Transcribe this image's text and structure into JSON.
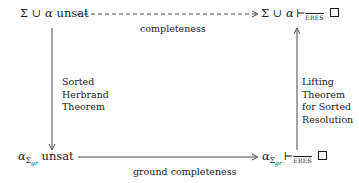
{
  "nodes": {
    "top_left": {
      "sigma": "Σ",
      "cup": "∪",
      "alpha": "α",
      "text": "unsat"
    },
    "top_right": {
      "sigma": "Σ",
      "cup": "∪",
      "alpha": "α",
      "turnstile": "⊢",
      "subscript": "ERES",
      "qed": "□"
    },
    "bottom_left": {
      "alpha": "α",
      "sub_sigma": "Σ",
      "sub_gr": "gr",
      "text": "unsat"
    },
    "bottom_right": {
      "alpha": "α",
      "sub_sigma": "Σ",
      "sub_gr": "gr",
      "turnstile": "⊢",
      "subscript": "ERES",
      "qed": "□"
    }
  },
  "edges": {
    "top": {
      "label": "completeness",
      "style": "dashed"
    },
    "bottom": {
      "label": "ground completeness",
      "style": "solid"
    },
    "left": {
      "label_lines": [
        "Sorted",
        "Herbrand",
        "Theorem"
      ],
      "direction": "down"
    },
    "right": {
      "label_lines": [
        "Lifting",
        "Theorem",
        "for Sorted",
        "Resolution"
      ],
      "direction": "up"
    }
  }
}
